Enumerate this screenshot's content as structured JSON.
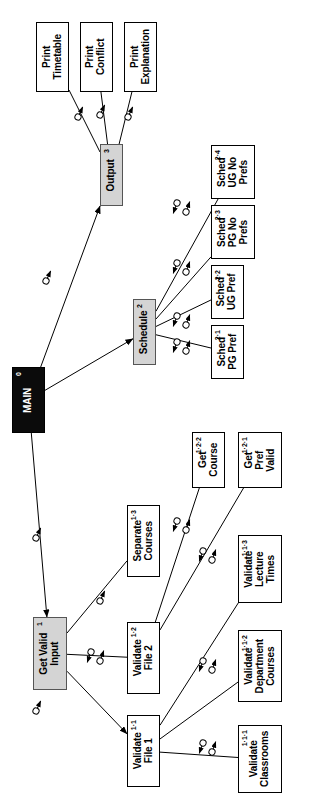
{
  "diagram": {
    "type": "structure-chart",
    "orientation": "rotated-90-ccw",
    "colors": {
      "root_fill": "#0b0b0b",
      "root_text": "#ffffff",
      "level_fill": "#d4d4d4",
      "leaf_fill": "#ffffff",
      "stroke": "#000000"
    },
    "modules": [
      {
        "id": "main",
        "number": "0",
        "label": "MAIN",
        "style": "black",
        "x": 12,
        "y": 367,
        "w": 33,
        "h": 66
      },
      {
        "id": "output",
        "number": "3",
        "label": "Output",
        "style": "gray",
        "x": 100,
        "y": 144,
        "w": 23,
        "h": 62
      },
      {
        "id": "schedule",
        "number": "2",
        "label": "Schedule",
        "style": "gray",
        "x": 133,
        "y": 299,
        "w": 23,
        "h": 66
      },
      {
        "id": "getvalid",
        "number": "1",
        "label": "Get Valid\nInput",
        "style": "gray",
        "x": 33,
        "y": 617,
        "w": 34,
        "h": 73
      },
      {
        "id": "printtt",
        "number": "",
        "label": "Print\nTimetable",
        "style": "leaf",
        "x": 36,
        "y": 22,
        "w": 33,
        "h": 70
      },
      {
        "id": "printcf",
        "number": "",
        "label": "Print\nConflict",
        "style": "leaf",
        "x": 80,
        "y": 22,
        "w": 33,
        "h": 70
      },
      {
        "id": "printex",
        "number": "",
        "label": "Print\nExplanation",
        "style": "leaf",
        "x": 124,
        "y": 22,
        "w": 33,
        "h": 70
      },
      {
        "id": "sch24",
        "number": "2·4",
        "label": "Sched\nUG No\nPrefs",
        "style": "leaf",
        "x": 211,
        "y": 145,
        "w": 44,
        "h": 54
      },
      {
        "id": "sch23",
        "number": "2·3",
        "label": "Sched\nPG No\nPrefs",
        "style": "leaf",
        "x": 211,
        "y": 205,
        "w": 44,
        "h": 54
      },
      {
        "id": "sch22",
        "number": "2·2",
        "label": "Sched\nUG Pref",
        "style": "leaf",
        "x": 211,
        "y": 265,
        "w": 33,
        "h": 54
      },
      {
        "id": "sch21",
        "number": "2·1",
        "label": "Sched\nPG Pref",
        "style": "leaf",
        "x": 211,
        "y": 325,
        "w": 33,
        "h": 54
      },
      {
        "id": "getcourse",
        "number": "1·2·2",
        "label": "Get\nCourse",
        "style": "leaf",
        "x": 192,
        "y": 432,
        "w": 33,
        "h": 56
      },
      {
        "id": "getpref",
        "number": "1·2·1",
        "label": "Get\nPref\nValid",
        "style": "leaf",
        "x": 238,
        "y": 432,
        "w": 44,
        "h": 56
      },
      {
        "id": "sepcourses",
        "number": "1·3",
        "label": "Separate\nCourses",
        "style": "leaf",
        "x": 127,
        "y": 505,
        "w": 33,
        "h": 72
      },
      {
        "id": "vallect",
        "number": "1·1·3",
        "label": "Validate\nLecture\nTimes",
        "style": "leaf",
        "x": 238,
        "y": 535,
        "w": 44,
        "h": 68
      },
      {
        "id": "valfile2",
        "number": "1·2",
        "label": "Validate\nFile 2",
        "style": "leaf",
        "x": 127,
        "y": 622,
        "w": 33,
        "h": 72
      },
      {
        "id": "valdept",
        "number": "1·1·2",
        "label": "Validate\nDepartment\nCourses",
        "style": "leaf",
        "x": 238,
        "y": 630,
        "w": 44,
        "h": 72
      },
      {
        "id": "valfile1",
        "number": "1·1",
        "label": "Validate\nFile 1",
        "style": "leaf",
        "x": 127,
        "y": 715,
        "w": 33,
        "h": 72
      },
      {
        "id": "valclass",
        "number": "1·1·1",
        "label": "Validate\nClassrooms",
        "style": "leaf",
        "x": 238,
        "y": 725,
        "w": 44,
        "h": 68
      }
    ],
    "links": [
      {
        "from": "main",
        "to": "output",
        "arrow": "solid"
      },
      {
        "from": "main",
        "to": "schedule",
        "arrow": "solid"
      },
      {
        "from": "main",
        "to": "getvalid",
        "arrow": "solid"
      },
      {
        "from": "output",
        "to": "printtt",
        "arrow": "plain"
      },
      {
        "from": "output",
        "to": "printcf",
        "arrow": "plain"
      },
      {
        "from": "output",
        "to": "printex",
        "arrow": "plain"
      },
      {
        "from": "schedule",
        "to": "sch21",
        "arrow": "plain"
      },
      {
        "from": "schedule",
        "to": "sch22",
        "arrow": "plain"
      },
      {
        "from": "schedule",
        "to": "sch23",
        "arrow": "plain"
      },
      {
        "from": "schedule",
        "to": "sch24",
        "arrow": "plain"
      },
      {
        "from": "getvalid",
        "to": "sepcourses",
        "arrow": "plain"
      },
      {
        "from": "getvalid",
        "to": "valfile2",
        "arrow": "plain"
      },
      {
        "from": "getvalid",
        "to": "valfile1",
        "arrow": "solid"
      },
      {
        "from": "valfile2",
        "to": "getcourse",
        "arrow": "plain"
      },
      {
        "from": "valfile2",
        "to": "getpref",
        "arrow": "plain"
      },
      {
        "from": "valfile1",
        "to": "vallect",
        "arrow": "plain"
      },
      {
        "from": "valfile1",
        "to": "valdept",
        "arrow": "plain"
      },
      {
        "from": "valfile1",
        "to": "valclass",
        "arrow": "plain"
      }
    ],
    "couples": [
      {
        "x": 78,
        "y": 117,
        "dir": "up",
        "pair": false
      },
      {
        "x": 100,
        "y": 115,
        "dir": "up",
        "pair": false
      },
      {
        "x": 128,
        "y": 117,
        "dir": "up",
        "pair": false
      },
      {
        "x": 46,
        "y": 281,
        "dir": "up",
        "pair": false
      },
      {
        "x": 186,
        "y": 212,
        "dir": "both",
        "pair": true
      },
      {
        "x": 186,
        "y": 272,
        "dir": "both",
        "pair": true
      },
      {
        "x": 186,
        "y": 325,
        "dir": "both",
        "pair": true
      },
      {
        "x": 186,
        "y": 351,
        "dir": "both",
        "pair": true
      },
      {
        "x": 36,
        "y": 538,
        "dir": "up",
        "pair": false
      },
      {
        "x": 100,
        "y": 601,
        "dir": "up",
        "pair": false
      },
      {
        "x": 100,
        "y": 661,
        "dir": "both",
        "pair": true
      },
      {
        "x": 36,
        "y": 711,
        "dir": "up",
        "pair": false
      },
      {
        "x": 186,
        "y": 530,
        "dir": "both",
        "pair": true
      },
      {
        "x": 212,
        "y": 560,
        "dir": "both",
        "pair": true
      },
      {
        "x": 212,
        "y": 670,
        "dir": "both",
        "pair": true
      },
      {
        "x": 212,
        "y": 752,
        "dir": "both",
        "pair": true
      }
    ]
  }
}
